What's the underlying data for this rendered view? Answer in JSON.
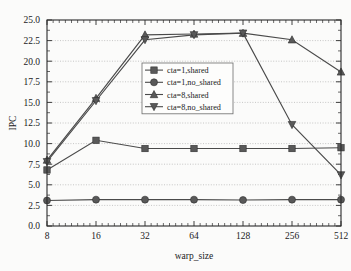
{
  "chart_data": {
    "type": "line",
    "title": "",
    "xlabel": "warp_size",
    "ylabel": "IPC",
    "x": [
      8,
      16,
      32,
      64,
      128,
      256,
      512
    ],
    "categories": [
      "8",
      "16",
      "32",
      "64",
      "128",
      "256",
      "512"
    ],
    "xscale": "log2",
    "ylim": [
      0.0,
      25.0
    ],
    "ytick_labels": [
      "0.0",
      "2.5",
      "5.0",
      "7.5",
      "10.0",
      "12.5",
      "15.0",
      "17.5",
      "20.0",
      "22.5",
      "25.0"
    ],
    "ytick_values": [
      0.0,
      2.5,
      5.0,
      7.5,
      10.0,
      12.5,
      15.0,
      17.5,
      20.0,
      22.5,
      25.0
    ],
    "xtick_labels": [
      "8",
      "16",
      "32",
      "64",
      "128",
      "256",
      "512"
    ],
    "grid": true,
    "grid_axis": "y",
    "legend_position": "upper-center-left",
    "series": [
      {
        "name": "cta=1,shared",
        "marker": "square",
        "values": [
          6.8,
          10.4,
          9.4,
          9.4,
          9.4,
          9.4,
          9.5
        ]
      },
      {
        "name": "cta=1,no_shared",
        "marker": "circle",
        "values": [
          3.1,
          3.2,
          3.2,
          3.2,
          3.15,
          3.2,
          3.2
        ]
      },
      {
        "name": "cta=8,shared",
        "marker": "triangle-up",
        "values": [
          8.0,
          15.5,
          23.2,
          23.3,
          23.4,
          22.6,
          18.7
        ]
      },
      {
        "name": "cta=8,no_shared",
        "marker": "triangle-down",
        "values": [
          7.8,
          15.2,
          22.6,
          23.2,
          23.4,
          12.3,
          6.2
        ]
      }
    ]
  },
  "colors": {
    "line": "#4a4a4a",
    "marker_fill": "#595959",
    "marker_stroke": "#2e2e2e",
    "axis": "#2b2b2b",
    "grid": "#9a9a9a",
    "background": "#fbfbfa",
    "legend_background": "#fdfdfc"
  }
}
